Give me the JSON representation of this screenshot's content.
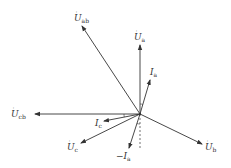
{
  "diagram": {
    "type": "phasor-diagram",
    "origin": [
      140,
      114
    ],
    "colors": {
      "line": "#333333",
      "background": "#ffffff"
    },
    "phasors": [
      {
        "id": "U_ab",
        "base": "U",
        "dot": true,
        "sub": "ab",
        "end": [
          82,
          26
        ],
        "label_pos": [
          76,
          20
        ]
      },
      {
        "id": "U_a",
        "base": "U",
        "dot": true,
        "sub": "a",
        "end": [
          140,
          45
        ],
        "label_pos": [
          136,
          39
        ]
      },
      {
        "id": "I_a",
        "base": "I",
        "dot": false,
        "sub": "a",
        "end": [
          150,
          80
        ],
        "label_pos": [
          152,
          74
        ]
      },
      {
        "id": "U_cb",
        "base": "U",
        "dot": true,
        "sub": "cb",
        "end": [
          35,
          114
        ],
        "label_pos": [
          12,
          117
        ]
      },
      {
        "id": "I_c",
        "base": "I",
        "dot": false,
        "sub": "c",
        "end": [
          104,
          121
        ],
        "label_pos": [
          94,
          127
        ]
      },
      {
        "id": "U_c",
        "base": "U",
        "dot": true,
        "sub": "c",
        "end": [
          81,
          143
        ],
        "label_pos": [
          66,
          149
        ]
      },
      {
        "id": "neg_I_a",
        "base": "−I",
        "dot": false,
        "sub": "a",
        "end": [
          129,
          148
        ],
        "label_pos": [
          118,
          159
        ]
      },
      {
        "id": "U_b",
        "base": "U",
        "dot": true,
        "sub": "b",
        "end": [
          202,
          144
        ],
        "label_pos": [
          205,
          150
        ]
      }
    ],
    "extra_lines": [
      {
        "id": "U_ab_extension",
        "from": [
          140,
          114
        ],
        "to": [
          129,
          98
        ]
      },
      {
        "id": "U_a_dashed_extension",
        "from": [
          140,
          114
        ],
        "to": [
          140,
          150
        ],
        "dashed": true
      }
    ]
  }
}
